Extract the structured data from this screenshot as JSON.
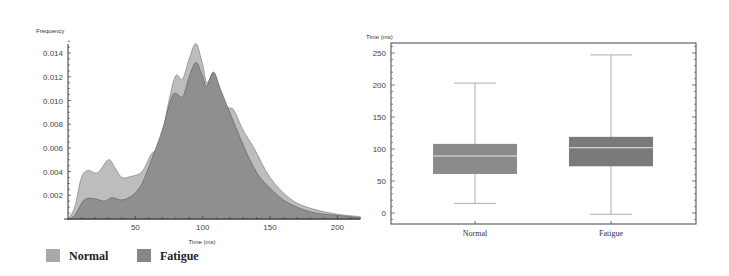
{
  "chart_data": [
    {
      "type": "area",
      "title": "",
      "xlabel": "Time (ms)",
      "ylabel": "Frequency",
      "xlim": [
        0,
        217
      ],
      "ylim": [
        0,
        0.0155
      ],
      "xticks": [
        50,
        100,
        150,
        200
      ],
      "yticks": [
        0.002,
        0.004,
        0.006,
        0.008,
        0.01,
        0.012,
        0.014
      ],
      "ytick_labels": [
        "0.002",
        "0.004",
        "0.006",
        "0.008",
        "0.010",
        "0.012",
        "0.014"
      ],
      "legend": [
        "Normal",
        "Fatigue"
      ],
      "legend_position": "bottom",
      "grid": false,
      "series": [
        {
          "name": "Normal",
          "color": "#bdbdbd",
          "x": [
            0,
            5,
            10,
            15,
            22,
            30,
            35,
            40,
            47,
            55,
            62,
            68,
            75,
            80,
            85,
            90,
            95,
            100,
            103,
            108,
            112,
            118,
            123,
            130,
            138,
            150,
            165,
            180,
            200,
            217
          ],
          "values": [
            0,
            0.001,
            0.0035,
            0.0041,
            0.0039,
            0.005,
            0.0043,
            0.0035,
            0.0036,
            0.004,
            0.0055,
            0.0062,
            0.01,
            0.0121,
            0.0118,
            0.0135,
            0.0148,
            0.013,
            0.0115,
            0.0123,
            0.011,
            0.0095,
            0.0092,
            0.0075,
            0.006,
            0.0035,
            0.0017,
            0.0009,
            0.0004,
            0.0002
          ]
        },
        {
          "name": "Fatigue",
          "color": "#8f8f8f",
          "x": [
            0,
            5,
            12,
            20,
            27,
            33,
            40,
            48,
            55,
            62,
            70,
            78,
            85,
            90,
            95,
            100,
            103,
            108,
            113,
            120,
            128,
            135,
            142,
            150,
            160,
            170,
            180,
            190,
            200,
            217
          ],
          "values": [
            0,
            0.0003,
            0.0016,
            0.0017,
            0.0015,
            0.0018,
            0.0016,
            0.002,
            0.003,
            0.005,
            0.0075,
            0.0105,
            0.0103,
            0.012,
            0.0132,
            0.012,
            0.0112,
            0.0124,
            0.011,
            0.009,
            0.0068,
            0.005,
            0.0036,
            0.0026,
            0.0016,
            0.001,
            0.0006,
            0.0004,
            0.0003,
            0.0001
          ]
        }
      ]
    },
    {
      "type": "box",
      "title": "",
      "xlabel": "",
      "ylabel": "Time (ms)",
      "ylim": [
        -12,
        265
      ],
      "yticks": [
        0,
        50,
        100,
        150,
        200,
        250
      ],
      "categories": [
        "Normal",
        "Fatigue"
      ],
      "grid": false,
      "series": [
        {
          "name": "Normal",
          "color": "#8a8a8a",
          "whisker_low": 15,
          "q1": 61,
          "median": 89,
          "q3": 108,
          "whisker_high": 203
        },
        {
          "name": "Fatigue",
          "color": "#7a7a7a",
          "whisker_low": -2,
          "q1": 73,
          "median": 102,
          "q3": 119,
          "whisker_high": 247
        }
      ]
    }
  ]
}
